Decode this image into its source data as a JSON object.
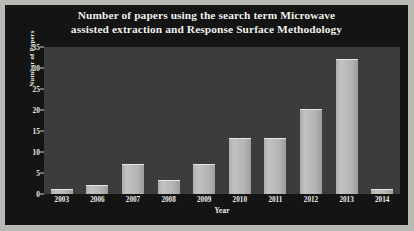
{
  "chart_data": {
    "type": "bar",
    "title": "Number of papers using the search term Microwave assisted extraction  and Response Surface Methodology",
    "title_line1": "Number of papers using the search term Microwave",
    "title_line2": "assisted extraction  and Response Surface Methodology",
    "xlabel": "Year",
    "ylabel": "Number of Papers",
    "categories": [
      "2003",
      "2006",
      "2007",
      "2008",
      "2009",
      "2010",
      "2011",
      "2012",
      "2013",
      "2014"
    ],
    "values": [
      1,
      2,
      7,
      3,
      7,
      13,
      13,
      20,
      32,
      1
    ],
    "ylim": [
      0,
      35
    ],
    "yticks": [
      0,
      5,
      10,
      15,
      20,
      25,
      30,
      35
    ],
    "grid": false,
    "legend": "none",
    "colors": {
      "figure_background": "#141414",
      "plot_background": "#3a3a3a",
      "bar_fill": "#b6b6b4",
      "text": "#efefea",
      "frame_border": "#b9b9b4"
    }
  }
}
